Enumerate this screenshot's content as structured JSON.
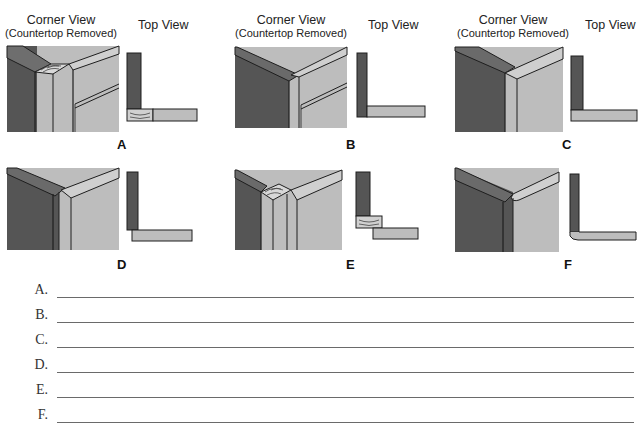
{
  "colors": {
    "dark_panel": "#555555",
    "light_panel": "#bdbdbd",
    "stroke": "#1e1e1e",
    "answer_line": "#6a6a6a"
  },
  "captions": {
    "corner_view": "Corner View",
    "corner_view_sub": "(Countertop Removed)",
    "top_view": "Top View"
  },
  "panels": [
    {
      "letter": "A",
      "style": "butt joint with solid wood corner post, face frame on right"
    },
    {
      "letter": "B",
      "style": "left panel butted into right panel with face frame"
    },
    {
      "letter": "C",
      "style": "right panel overlaps end of left panel"
    },
    {
      "letter": "D",
      "style": "left panel overlaps right panel with offset"
    },
    {
      "letter": "E",
      "style": "solid wood corner block joining both panels"
    },
    {
      "letter": "F",
      "style": "rounded/bent continuous corner"
    }
  ],
  "answers": {
    "labels": [
      "A.",
      "B.",
      "C.",
      "D.",
      "E.",
      "F."
    ],
    "values": [
      "",
      "",
      "",
      "",
      "",
      ""
    ]
  }
}
